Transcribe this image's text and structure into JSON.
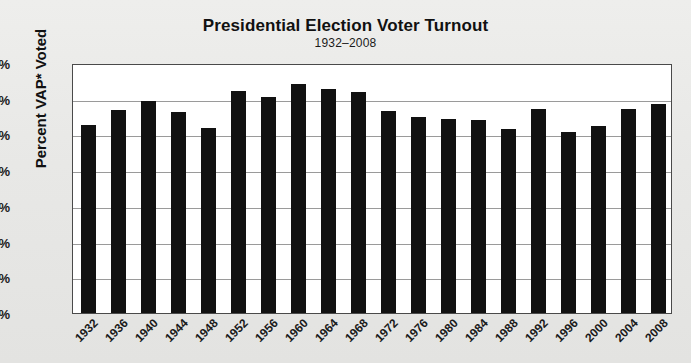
{
  "chart_data": {
    "type": "bar",
    "title": "Presidential Election Voter Turnout",
    "subtitle": "1932–2008",
    "xlabel": "",
    "ylabel": "Percent VAP* Voted",
    "ylim": [
      0,
      70
    ],
    "ytick_step": 10,
    "grid": true,
    "legend": "none",
    "bar_color": "#111111",
    "plot_background": "#ffffff",
    "page_background": "#e8e8e6",
    "categories": [
      "1932",
      "1936",
      "1940",
      "1944",
      "1948",
      "1952",
      "1956",
      "1960",
      "1964",
      "1968",
      "1972",
      "1976",
      "1980",
      "1984",
      "1988",
      "1992",
      "1996",
      "2000",
      "2004",
      "2008"
    ],
    "values": [
      52.6,
      56.9,
      59.4,
      56.3,
      51.7,
      62.3,
      60.6,
      64.0,
      62.8,
      62.0,
      56.5,
      54.8,
      54.2,
      54.0,
      51.5,
      57.1,
      50.8,
      52.4,
      57.0,
      58.4
    ],
    "ytick_labels": [
      "0%",
      "10%",
      "20%",
      "30%",
      "40%",
      "50%",
      "60%",
      "70%"
    ],
    "ytick_values": [
      0,
      10,
      20,
      30,
      40,
      50,
      60,
      70
    ]
  }
}
